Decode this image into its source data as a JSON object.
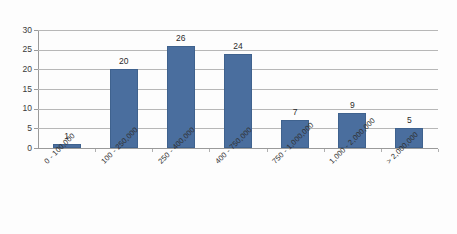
{
  "chart_data": {
    "type": "bar",
    "title": "",
    "subtitle": "",
    "xlabel": "",
    "ylabel": "",
    "categories": [
      "0 - 100,000",
      "100 - 250,000",
      "250 - 400,000",
      "400 - 750,000",
      "750 - 1,000,000",
      "1,000 - 2,000,000",
      "> 2,000,000"
    ],
    "values": [
      1,
      20,
      26,
      24,
      7,
      9,
      5
    ],
    "data_labels": [
      "1",
      "20",
      "26",
      "24",
      "7",
      "9",
      "5"
    ],
    "ylim": [
      0,
      30
    ],
    "ytick_labels": [
      "0",
      "5",
      "10",
      "15",
      "20",
      "25",
      "30"
    ],
    "ytick_values": [
      0,
      5,
      10,
      15,
      20,
      25,
      30
    ],
    "grid": true,
    "grid_axis": "y",
    "legend": false,
    "legend_position": "none",
    "series": [
      {
        "name": "",
        "values": [
          1,
          20,
          26,
          24,
          7,
          9,
          5
        ]
      }
    ],
    "colors": {
      "bar": "#4a6e9e",
      "bar_border": "#3f628e",
      "gridline": "#b7b7b7",
      "axis": "#9a9a9a",
      "text": "#2f2f2f",
      "background": "#fdfdfd"
    },
    "x_label_rotation": -45
  }
}
